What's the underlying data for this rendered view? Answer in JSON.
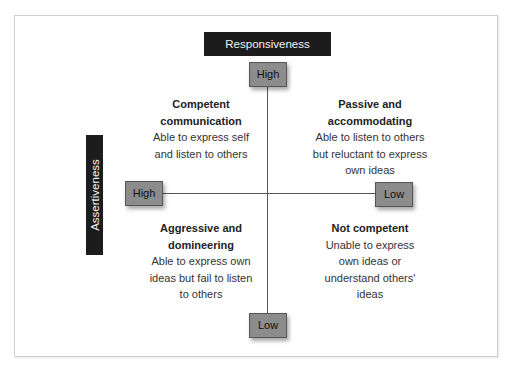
{
  "axes": {
    "horizontal_title": "Responsiveness",
    "vertical_title": "Assertiveness",
    "top_pole": "High",
    "bottom_pole": "Low",
    "left_pole": "High",
    "right_pole": "Low"
  },
  "quadrants": {
    "top_left": {
      "title_line1": "Competent",
      "title_line2": "communication",
      "desc_line1": "Able to express self",
      "desc_line2": "and listen to others"
    },
    "top_right": {
      "title_line1": "Passive and",
      "title_line2": "accommodating",
      "desc_line1": "Able to listen to others",
      "desc_line2": "but reluctant to express",
      "desc_line3": "own ideas"
    },
    "bottom_left": {
      "title_line1": "Aggressive and",
      "title_line2": "domineering",
      "desc_line1": "Able to express own",
      "desc_line2": "ideas but fail to listen",
      "desc_line3": "to others"
    },
    "bottom_right": {
      "title_line1": "Not competent",
      "desc_line1": "Unable to express",
      "desc_line2": "own ideas or",
      "desc_line3": "understand others'",
      "desc_line4": "ideas"
    }
  },
  "colors": {
    "label_box": "#1c1c1c",
    "pole_box": "#8c8c8c",
    "axis_line": "#555555"
  }
}
